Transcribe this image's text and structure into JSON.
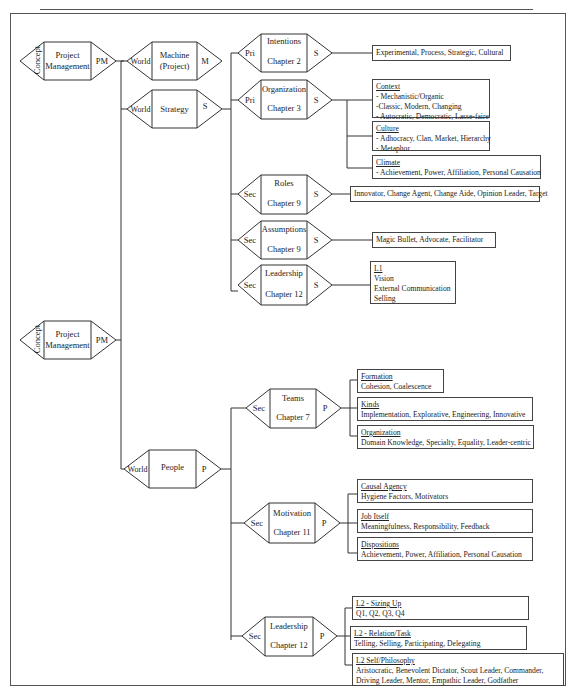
{
  "concept_nodes": [
    {
      "left": "Concept",
      "center": "Project Management",
      "right": "PM"
    },
    {
      "left": "Concept",
      "center": "Project Management",
      "right": "PM"
    }
  ],
  "world_nodes": [
    {
      "left": "World",
      "center": "Machine (Project)",
      "right": "M"
    },
    {
      "left": "World",
      "center": "Strategy",
      "right": "S"
    },
    {
      "left": "World",
      "center": "People",
      "right": "P"
    }
  ],
  "strategy_nodes": [
    {
      "left": "Pri",
      "title": "Intentions",
      "chapter": "Chapter 2",
      "right": "S"
    },
    {
      "left": "Pri",
      "title": "Organization",
      "chapter": "Chapter 3",
      "right": "S"
    },
    {
      "left": "Sec",
      "title": "Roles",
      "chapter": "Chapter 9",
      "right": "S"
    },
    {
      "left": "Sec",
      "title": "Assumptions",
      "chapter": "Chapter 9",
      "right": "S"
    },
    {
      "left": "Sec",
      "title": "Leadership",
      "chapter": "Chapter 12",
      "right": "S"
    }
  ],
  "people_nodes": [
    {
      "left": "Sec",
      "title": "Teams",
      "chapter": "Chapter 7",
      "right": "P"
    },
    {
      "left": "Sec",
      "title": "Motivation",
      "chapter": "Chapter 11",
      "right": "P"
    },
    {
      "left": "Sec",
      "title": "Leadership",
      "chapter": "Chapter 12",
      "right": "P"
    }
  ],
  "boxes": {
    "intentions": {
      "lines": [
        "Experimental, Process, Strategic, Cultural"
      ]
    },
    "context": {
      "title": "Context",
      "lines": [
        "- Mechanistic/Organic",
        "-Classic, Modern, Changing",
        "- Autocratic, Democratic, Lasse-faire"
      ]
    },
    "culture": {
      "title": "Culture",
      "lines": [
        "- Adhocracy, Clan, Market, Hierarchy",
        "- Metaphor"
      ]
    },
    "climate": {
      "title": "Climate",
      "lines": [
        "- Achievement, Power, Affiliation, Personal Causation"
      ]
    },
    "roles": {
      "lines": [
        "Innovator, Change Agent, Change Aide, Opinion Leader, Target"
      ]
    },
    "assumptions": {
      "lines": [
        "Magic Bullet, Advocate, Facilitator"
      ]
    },
    "leadership_s": {
      "title": "L1",
      "lines": [
        "Vision",
        "External Communication",
        "Selling"
      ]
    },
    "formation": {
      "title": "Formation",
      "lines": [
        "Cohesion, Coalescence"
      ]
    },
    "kinds": {
      "title": "Kinds",
      "lines": [
        "Implementation, Explorative, Engineering, Innovative"
      ]
    },
    "organization_p": {
      "title": "Organization",
      "lines": [
        "Domain Knowledge, Specialty, Equality, Leader-centric"
      ]
    },
    "causal_agency": {
      "title": "Causal Agency",
      "lines": [
        "Hygiene Factors, Motivators"
      ]
    },
    "job_itself": {
      "title": "Job Itself",
      "lines": [
        "Meaningfulness, Responsibility, Feedback"
      ]
    },
    "dispositions": {
      "title": "Dispositions",
      "lines": [
        "Achievement, Power, Affiliation, Personal Causation"
      ]
    },
    "sizing_up": {
      "title": "L2 -  Sizing Up",
      "lines": [
        "Q1, Q2, Q3, Q4"
      ]
    },
    "relation_task": {
      "title": "L2 - Relation/Task",
      "lines": [
        "Telling, Selling, Participating, Delegating"
      ]
    },
    "self_philosophy": {
      "title": "L2 Self/Philosophy",
      "lines": [
        " Aristocratic, Benevolent Dictator, Scout Leader, Commander,",
        "Driving Leader, Mentor, Empathic Leader, Godfather"
      ]
    }
  }
}
